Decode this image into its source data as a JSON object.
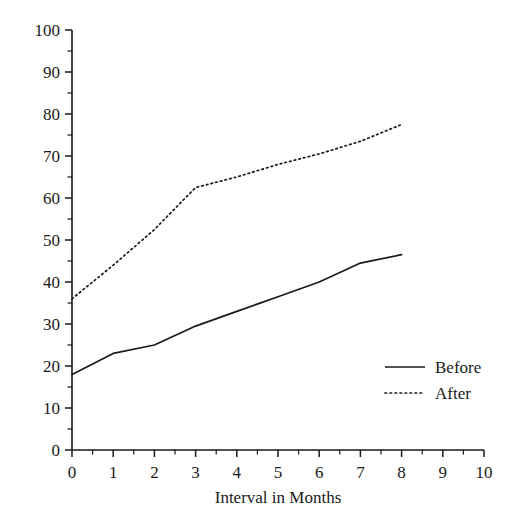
{
  "chart_data": {
    "type": "line",
    "title": "",
    "subtitle": "",
    "xlabel": "Interval in Months",
    "ylabel": "",
    "xlim": [
      0,
      10
    ],
    "ylim": [
      0,
      100
    ],
    "x": [
      0,
      1,
      2,
      3,
      4,
      5,
      6,
      7,
      8
    ],
    "xticks": [
      0,
      1,
      2,
      3,
      4,
      5,
      6,
      7,
      8,
      9,
      10
    ],
    "xtick_labels": [
      "0",
      "1",
      "2",
      "3",
      "4",
      "5",
      "6",
      "7",
      "8",
      "9",
      "10"
    ],
    "x_minor_tick_step": 0.5,
    "yticks": [
      0,
      10,
      20,
      30,
      40,
      50,
      60,
      70,
      80,
      90,
      100
    ],
    "ytick_labels": [
      "0",
      "10",
      "20",
      "30",
      "40",
      "50",
      "60",
      "70",
      "80",
      "90",
      "100"
    ],
    "y_minor_tick_step": 5,
    "grid": false,
    "legend_position": "center-right",
    "line_color": "#1a1a1a",
    "background_color": "#ffffff",
    "series": [
      {
        "name": "Before",
        "style": "solid",
        "values": [
          18,
          23,
          25,
          29.5,
          33,
          36.5,
          40,
          44.5,
          46.5
        ]
      },
      {
        "name": "After",
        "style": "dotted",
        "values": [
          36,
          44,
          52.5,
          62.5,
          65,
          68,
          70.5,
          73.5,
          77.5
        ]
      }
    ]
  },
  "legend": {
    "items": [
      {
        "label": "Before"
      },
      {
        "label": "After"
      }
    ]
  }
}
